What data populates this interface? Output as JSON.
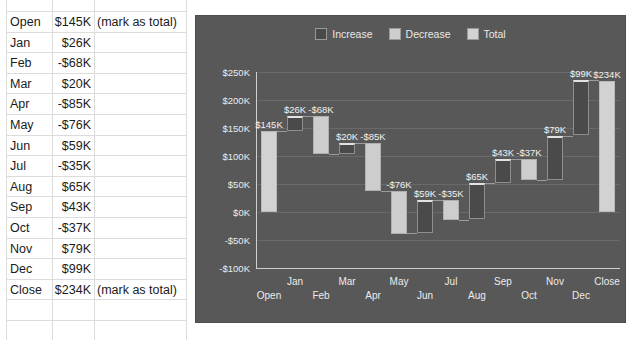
{
  "spreadsheet": {
    "note_total": "(mark as total)",
    "rows": [
      {
        "label": "Open",
        "value": "$145K",
        "note": "(mark as total)"
      },
      {
        "label": "Jan",
        "value": "$26K",
        "note": ""
      },
      {
        "label": "Feb",
        "value": "-$68K",
        "note": ""
      },
      {
        "label": "Mar",
        "value": "$20K",
        "note": ""
      },
      {
        "label": "Apr",
        "value": "-$85K",
        "note": ""
      },
      {
        "label": "May",
        "value": "-$76K",
        "note": ""
      },
      {
        "label": "Jun",
        "value": "$59K",
        "note": ""
      },
      {
        "label": "Jul",
        "value": "-$35K",
        "note": ""
      },
      {
        "label": "Aug",
        "value": "$65K",
        "note": ""
      },
      {
        "label": "Sep",
        "value": "$43K",
        "note": ""
      },
      {
        "label": "Oct",
        "value": "-$37K",
        "note": ""
      },
      {
        "label": "Nov",
        "value": "$79K",
        "note": ""
      },
      {
        "label": "Dec",
        "value": "$99K",
        "note": ""
      },
      {
        "label": "Close",
        "value": "$234K",
        "note": "(mark as total)"
      }
    ]
  },
  "chart_data": {
    "type": "bar",
    "subtype": "waterfall",
    "title": "",
    "xlabel": "",
    "ylabel": "",
    "ylim": [
      -100,
      250
    ],
    "ytick_values": [
      250,
      200,
      150,
      100,
      50,
      0,
      -50,
      -100
    ],
    "ytick_labels": [
      "$250K",
      "$200K",
      "$150K",
      "$100K",
      "$50K",
      "$0K",
      "-$50K",
      "-$100K"
    ],
    "grid": true,
    "legend_position": "top",
    "legend": [
      {
        "label": "Increase",
        "color": "#4a4a4a"
      },
      {
        "label": "Decrease",
        "color": "#cdcdcd"
      },
      {
        "label": "Total",
        "color": "#d2d2d2"
      }
    ],
    "categories": [
      "Open",
      "Jan",
      "Feb",
      "Mar",
      "Apr",
      "May",
      "Jun",
      "Jul",
      "Aug",
      "Sep",
      "Oct",
      "Nov",
      "Dec",
      "Close"
    ],
    "values": [
      145,
      26,
      -68,
      20,
      -85,
      -76,
      59,
      -35,
      65,
      43,
      -37,
      79,
      99,
      234
    ],
    "kinds": [
      "total",
      "increase",
      "decrease",
      "increase",
      "decrease",
      "decrease",
      "increase",
      "decrease",
      "increase",
      "increase",
      "decrease",
      "increase",
      "increase",
      "total"
    ],
    "data_labels": [
      "$145K",
      "$26K",
      "-$68K",
      "$20K",
      "-$85K",
      "-$76K",
      "$59K",
      "-$35K",
      "$65K",
      "$43K",
      "-$37K",
      "$79K",
      "$99K",
      "$234K"
    ],
    "colors": {
      "plot_background": "#585858",
      "increase": "#4a4a4a",
      "decrease": "#cdcdcd",
      "total": "#d2d2d2",
      "gridline": "#6a6a6a",
      "axis": "#cfcfcf",
      "text": "#ececec"
    }
  }
}
